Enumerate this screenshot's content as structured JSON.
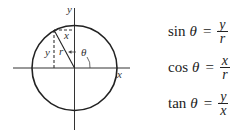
{
  "diagram": {
    "axes": {
      "x_label": "x",
      "y_label": "y"
    },
    "triangle_labels": {
      "x": "x",
      "y": "y",
      "r": "r",
      "angle": "θ"
    },
    "colors": {
      "stroke": "#222222",
      "background": "#ffffff"
    }
  },
  "formulas": [
    {
      "fn": "sin",
      "var": "θ",
      "eq": "=",
      "num": "y",
      "den": "r"
    },
    {
      "fn": "cos",
      "var": "θ",
      "eq": "=",
      "num": "x",
      "den": "r"
    },
    {
      "fn": "tan",
      "var": "θ",
      "eq": "=",
      "num": "y",
      "den": "x"
    }
  ]
}
